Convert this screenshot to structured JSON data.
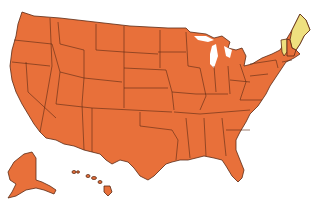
{
  "map": {
    "type": "choropleth",
    "region": "United States",
    "colors": {
      "default_fill": "#E8703A",
      "highlight_fill": "#EFE07F",
      "border": "#5A2A14",
      "background": "#FFFFFF"
    },
    "highlighted_states": [
      "Maine",
      "Vermont"
    ],
    "default_states_note": "All other states including Alaska and Hawaii",
    "insets": [
      "Alaska",
      "Hawaii"
    ]
  }
}
